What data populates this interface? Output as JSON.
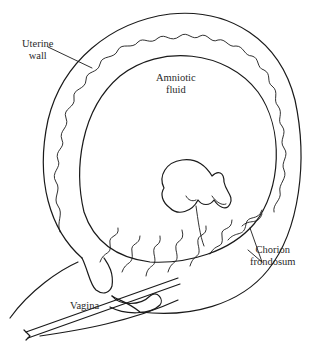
{
  "diagram": {
    "labels": {
      "uterine_wall_line1": "Uterine",
      "uterine_wall_line2": "wall",
      "amniotic_fluid_line1": "Amniotic",
      "amniotic_fluid_line2": "fluid",
      "chorion_line1": "Chorion",
      "chorion_line2": "frondosum",
      "vagina": "Vagina"
    },
    "colors": {
      "line": "#1a1a1a",
      "background": "#ffffff",
      "text": "#2a2a2a"
    }
  }
}
